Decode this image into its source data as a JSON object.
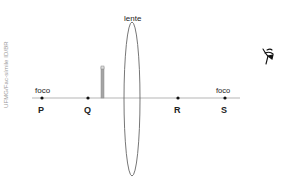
{
  "credit": "UFMG/Fac-símile ID/BR",
  "lens": {
    "label": "lente"
  },
  "focus_left": {
    "label": "foco"
  },
  "focus_right": {
    "label": "foco"
  },
  "points": [
    {
      "label": "P"
    },
    {
      "label": "Q"
    },
    {
      "label": "R"
    },
    {
      "label": "S"
    }
  ],
  "colors": {
    "axis": "#b5b5b5",
    "lens": "#666666",
    "object": "#999999",
    "ink": "#222222"
  }
}
